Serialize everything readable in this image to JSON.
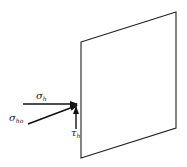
{
  "diagram": {
    "type": "stress-on-plane",
    "plane": {
      "corners": [
        [
          81,
          42
        ],
        [
          176,
          12
        ],
        [
          176,
          128
        ],
        [
          81,
          158
        ]
      ],
      "stroke": "#222222"
    },
    "arrows": [
      {
        "name": "sigma-h",
        "from": [
          23,
          104
        ],
        "to": [
          78,
          104
        ]
      },
      {
        "name": "sigma-ho",
        "from": [
          28,
          124
        ],
        "to": [
          78,
          105
        ]
      },
      {
        "name": "tau-h",
        "from": [
          76,
          129
        ],
        "to": [
          76,
          106
        ]
      }
    ],
    "labels": {
      "sigma_h": {
        "symbol": "σ",
        "sub": "h"
      },
      "sigma_ho": {
        "symbol": "σ",
        "sub": "ho"
      },
      "tau_h": {
        "symbol": "τ",
        "sub": "h"
      }
    }
  }
}
